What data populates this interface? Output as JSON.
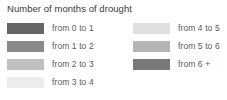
{
  "legend": {
    "title": "Number of months of drought",
    "title_color": "#3a3a3a",
    "label_color": "#5a5a5a",
    "background_color": "#ffffff",
    "columns": [
      {
        "name": "left",
        "entries": [
          {
            "label": "from 0 to 1",
            "color": "#666666"
          },
          {
            "label": "from 1 to 2",
            "color": "#8a8a8a"
          },
          {
            "label": "from 2 to 3",
            "color": "#c0c0c0"
          },
          {
            "label": "from 3 to 4",
            "color": "#ececec"
          }
        ]
      },
      {
        "name": "right",
        "entries": [
          {
            "label": "from 4 to 5",
            "color": "#e0e0e0"
          },
          {
            "label": "from 5 to 6",
            "color": "#b5b5b5"
          },
          {
            "label": "from 6 +",
            "color": "#787878"
          }
        ]
      }
    ]
  },
  "chart_data": {
    "type": "table",
    "title": "Number of months of drought",
    "xlabel": "",
    "ylabel": "",
    "legend_position": "two-column",
    "categories": [
      "from 0 to 1",
      "from 1 to 2",
      "from 2 to 3",
      "from 3 to 4",
      "from 4 to 5",
      "from 5 to 6",
      "from 6 +"
    ],
    "colors": [
      "#666666",
      "#8a8a8a",
      "#c0c0c0",
      "#ececec",
      "#e0e0e0",
      "#b5b5b5",
      "#787878"
    ],
    "bin_ranges": [
      [
        0,
        1
      ],
      [
        1,
        2
      ],
      [
        2,
        3
      ],
      [
        3,
        4
      ],
      [
        4,
        5
      ],
      [
        5,
        6
      ],
      [
        6,
        null
      ]
    ],
    "units": "months"
  }
}
